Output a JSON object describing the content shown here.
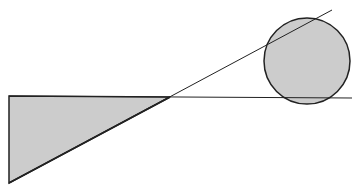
{
  "diagram": {
    "width": 361,
    "height": 192,
    "background": "#ffffff",
    "fill_color": "#cccccc",
    "stroke_color": "#222222",
    "triangle": {
      "points": [
        [
          9,
          96
        ],
        [
          170,
          97
        ],
        [
          9,
          183
        ]
      ]
    },
    "horizontal_line": {
      "x1": 9,
      "y1": 96,
      "x2": 352,
      "y2": 98
    },
    "diagonal_line": {
      "x1": 9,
      "y1": 183,
      "x2": 332,
      "y2": 10
    },
    "circle": {
      "cx": 307,
      "cy": 61,
      "r": 43
    }
  }
}
